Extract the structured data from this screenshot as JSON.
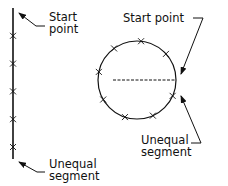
{
  "linear_diagram": {
    "start_label": [
      "Start",
      "point"
    ],
    "end_label": [
      "Unequal",
      "segment"
    ],
    "division_marks": 5
  },
  "circular_diagram": {
    "start_label": "Start point",
    "end_label": [
      "Unequal",
      "segment"
    ],
    "division_marks": 8
  },
  "colors": {
    "ink": "#111111",
    "background": "#ffffff"
  }
}
